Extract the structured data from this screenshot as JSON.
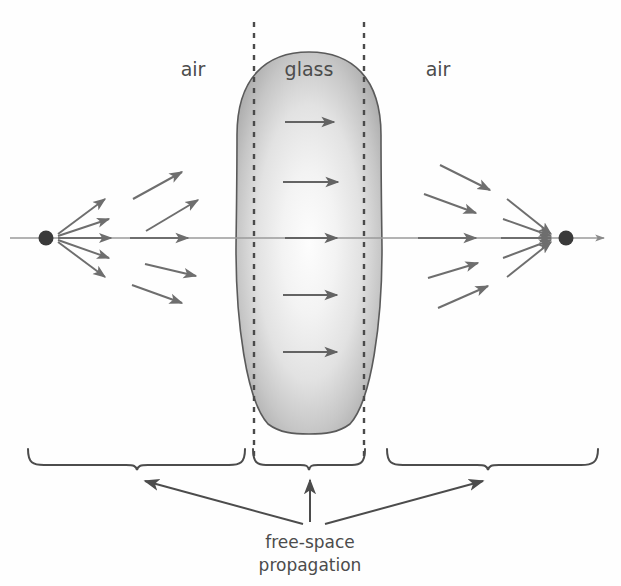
{
  "figure": {
    "title_visible": false,
    "background_color": "#fefefe",
    "width": 621,
    "height": 586
  },
  "labels": {
    "air_left": "air",
    "glass": "glass",
    "air_right": "air",
    "caption_line1": "free-space",
    "caption_line2": "propagation"
  },
  "colors": {
    "ink": "#4c4c4c",
    "ray": "#6e6e6e",
    "axis": "#8a8a8a",
    "glass_edge": "#5a5a5a",
    "glass_dark": "#a8a8a8",
    "glass_light": "#fbfbfb",
    "dash": "#4a4a4a",
    "point": "#3a3a3a"
  },
  "geometry": {
    "optical_axis": {
      "y": 238,
      "x_start": 10,
      "x_end": 612
    },
    "source_point": {
      "x": 46,
      "y": 238,
      "r": 7
    },
    "focus_point": {
      "x": 566,
      "y": 238,
      "r": 7
    },
    "lens": {
      "left": 237,
      "right": 382,
      "top": 52,
      "bottom": 434,
      "center_x": 309
    },
    "dashed_line_left_x": 254,
    "dashed_line_right_x": 364
  },
  "glass_arrows": {
    "note": "plane-wave arrows inside glass, all horizontal pointing right",
    "items": [
      {
        "y": 122,
        "x1": 285,
        "x2": 338
      },
      {
        "y": 182,
        "x1": 283,
        "x2": 342
      },
      {
        "y": 238,
        "x1": 285,
        "x2": 341
      },
      {
        "y": 295,
        "x1": 283,
        "x2": 341
      },
      {
        "y": 352,
        "x1": 283,
        "x2": 341
      }
    ]
  },
  "source_rays": {
    "note": "short diverging rays emanating from the source point",
    "items": [
      {
        "x1": 58,
        "y1": 235,
        "x2": 108,
        "y2": 198
      },
      {
        "x1": 58,
        "y1": 236,
        "x2": 112,
        "y2": 218
      },
      {
        "x1": 58,
        "y1": 238,
        "x2": 114,
        "y2": 238
      },
      {
        "x1": 58,
        "y1": 240,
        "x2": 112,
        "y2": 258
      },
      {
        "x1": 58,
        "y1": 242,
        "x2": 108,
        "y2": 278
      }
    ]
  },
  "focus_rays": {
    "note": "short converging rays arriving at the focus point",
    "items": [
      {
        "x1": 504,
        "y1": 198,
        "x2": 554,
        "y2": 235
      },
      {
        "x1": 500,
        "y1": 218,
        "x2": 554,
        "y2": 236
      },
      {
        "x1": 498,
        "y1": 238,
        "x2": 554,
        "y2": 238
      },
      {
        "x1": 500,
        "y1": 258,
        "x2": 554,
        "y2": 240
      },
      {
        "x1": 504,
        "y1": 278,
        "x2": 554,
        "y2": 242
      }
    ]
  },
  "air_left_rays": {
    "note": "longer diverging rays in the left air region",
    "items": [
      {
        "x1": 133,
        "y1": 199,
        "x2": 186,
        "y2": 169
      },
      {
        "x1": 146,
        "y1": 231,
        "x2": 202,
        "y2": 198
      },
      {
        "x1": 130,
        "y1": 237,
        "x2": 192,
        "y2": 238
      },
      {
        "x1": 145,
        "y1": 265,
        "x2": 200,
        "y2": 278
      },
      {
        "x1": 132,
        "y1": 285,
        "x2": 186,
        "y2": 305
      }
    ]
  },
  "air_right_rays": {
    "note": "longer converging rays in the right air region",
    "items": [
      {
        "x1": 440,
        "y1": 165,
        "x2": 494,
        "y2": 193
      },
      {
        "x1": 424,
        "y1": 194,
        "x2": 480,
        "y2": 215
      },
      {
        "x1": 418,
        "y1": 238,
        "x2": 480,
        "y2": 238
      },
      {
        "x1": 428,
        "y1": 278,
        "x2": 482,
        "y2": 262
      },
      {
        "x1": 438,
        "y1": 308,
        "x2": 492,
        "y2": 284
      }
    ]
  },
  "braces": {
    "left": {
      "x1": 28,
      "x2": 245,
      "top_y": 449,
      "dip_y": 470
    },
    "middle": {
      "x1": 253,
      "x2": 365,
      "top_y": 449,
      "dip_y": 470
    },
    "right": {
      "x1": 387,
      "x2": 598,
      "top_y": 449,
      "dip_y": 470
    }
  },
  "caption_arrows": {
    "left": {
      "x1": 303,
      "y1": 524,
      "x2": 141,
      "y2": 479
    },
    "middle": {
      "x1": 310,
      "y1": 524,
      "x2": 310,
      "y2": 478
    },
    "right": {
      "x1": 325,
      "y1": 524,
      "x2": 487,
      "y2": 479
    }
  },
  "label_positions": {
    "air_left": {
      "x": 193,
      "y": 76
    },
    "glass": {
      "x": 309,
      "y": 76
    },
    "air_right": {
      "x": 438,
      "y": 76
    },
    "caption_line1": {
      "x": 310,
      "y": 547
    },
    "caption_line2": {
      "x": 310,
      "y": 570
    }
  }
}
